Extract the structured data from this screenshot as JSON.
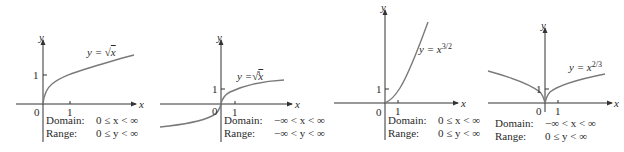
{
  "figure": {
    "panels": [
      {
        "id": "sqrt",
        "equation": {
          "lhs": "y = ",
          "radical": "√",
          "radical_index": "",
          "arg": "x",
          "base": "",
          "exponent": ""
        },
        "axis_labels": {
          "x": "x",
          "y": "y"
        },
        "ticks": {
          "origin": "0",
          "x_one": "1",
          "y_one": "1"
        },
        "domain": {
          "label": "Domain:",
          "value": "0 ≤ x < ∞"
        },
        "range": {
          "label": "Range:",
          "value": "0 ≤ y < ∞"
        }
      },
      {
        "id": "cbrt",
        "equation": {
          "lhs": "y = ",
          "radical": "√",
          "radical_index": "3",
          "arg": "x",
          "base": "",
          "exponent": ""
        },
        "axis_labels": {
          "x": "x",
          "y": "y"
        },
        "ticks": {
          "origin": "0",
          "x_one": "1",
          "y_one": "1"
        },
        "domain": {
          "label": "Domain:",
          "value": "−∞ < x < ∞"
        },
        "range": {
          "label": "Range:",
          "value": "−∞ < y < ∞"
        }
      },
      {
        "id": "x32",
        "equation": {
          "lhs": "y = ",
          "radical": "",
          "radical_index": "",
          "arg": "",
          "base": "x",
          "exponent": "3/2"
        },
        "axis_labels": {
          "x": "x",
          "y": "y"
        },
        "ticks": {
          "origin": "0",
          "x_one": "1",
          "y_one": "1"
        },
        "domain": {
          "label": "Domain:",
          "value": "0 ≤ x < ∞"
        },
        "range": {
          "label": "Range:",
          "value": "0 ≤ y < ∞"
        }
      },
      {
        "id": "x23",
        "equation": {
          "lhs": "y = ",
          "radical": "",
          "radical_index": "",
          "arg": "",
          "base": "x",
          "exponent": "2/3"
        },
        "axis_labels": {
          "x": "x",
          "y": "y"
        },
        "ticks": {
          "origin": "0",
          "x_one": "1",
          "y_one": "1"
        },
        "domain": {
          "label": "Domain:",
          "value": "−∞ < x < ∞"
        },
        "range": {
          "label": "Range:",
          "value": "0 ≤ y < ∞"
        }
      }
    ],
    "colors": {
      "axis": "#333333",
      "curve": "#7a7a7a",
      "text": "#2a2a2a"
    }
  }
}
